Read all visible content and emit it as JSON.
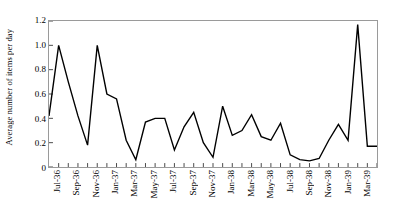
{
  "chart_data": {
    "type": "line",
    "title": "",
    "xlabel": "",
    "ylabel": "Average number of items per day",
    "ylim": [
      0,
      1.2
    ],
    "ytick_labels": [
      "0",
      "0.2",
      "0.4",
      "0.6",
      "0.8",
      "1.0",
      "1.2"
    ],
    "ytick_values": [
      0,
      0.2,
      0.4,
      0.6,
      0.8,
      1.0,
      1.2
    ],
    "grid": false,
    "legend": "none",
    "xtick_labels": [
      "Jul-36",
      "Sep-36",
      "Nov-36",
      "Jan-37",
      "Mar-37",
      "May-37",
      "Jul-37",
      "Sep-37",
      "Nov-37",
      "Jan-38",
      "Mar-38",
      "May-38",
      "Jul-38",
      "Sep-38",
      "Nov-38",
      "Jan-39",
      "Mar-39"
    ],
    "x": [
      "Jun-36",
      "Jul-36",
      "Aug-36",
      "Sep-36",
      "Oct-36",
      "Nov-36",
      "Dec-36",
      "Jan-37",
      "Feb-37",
      "Mar-37",
      "Apr-37",
      "May-37",
      "Jun-37",
      "Jul-37",
      "Aug-37",
      "Sep-37",
      "Oct-37",
      "Nov-37",
      "Dec-37",
      "Jan-38",
      "Feb-38",
      "Mar-38",
      "Apr-38",
      "May-38",
      "Jun-38",
      "Jul-38",
      "Aug-38",
      "Sep-38",
      "Oct-38",
      "Nov-38",
      "Dec-38",
      "Jan-39",
      "Feb-39",
      "Mar-39",
      "Apr-39"
    ],
    "values": [
      0.42,
      1.0,
      0.7,
      0.42,
      0.18,
      1.0,
      0.6,
      0.56,
      0.22,
      0.06,
      0.37,
      0.4,
      0.4,
      0.14,
      0.33,
      0.45,
      0.2,
      0.08,
      0.5,
      0.26,
      0.3,
      0.43,
      0.25,
      0.22,
      0.36,
      0.1,
      0.06,
      0.05,
      0.07,
      0.22,
      0.35,
      0.22,
      1.17,
      0.17,
      0.17
    ],
    "series": [
      {
        "name": "Average number of items per day",
        "values": [
          0.42,
          1.0,
          0.7,
          0.42,
          0.18,
          1.0,
          0.6,
          0.56,
          0.22,
          0.06,
          0.37,
          0.4,
          0.4,
          0.14,
          0.33,
          0.45,
          0.2,
          0.08,
          0.5,
          0.26,
          0.3,
          0.43,
          0.25,
          0.22,
          0.36,
          0.1,
          0.06,
          0.05,
          0.07,
          0.22,
          0.35,
          0.22,
          1.17,
          0.17,
          0.17
        ],
        "color": "#000000"
      }
    ],
    "line_color": "#000000",
    "frame_color": "#9a9a9a",
    "background": "#ffffff"
  }
}
